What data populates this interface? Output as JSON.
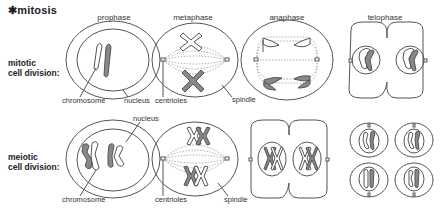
{
  "title": "✱mitosis",
  "phases": [
    "prophase",
    "metaphase",
    "anaphase",
    "telophase"
  ],
  "rows": [
    {
      "label_line1": "mitotic",
      "label_line2": "cell division:"
    },
    {
      "label_line1": "meiotic",
      "label_line2": "cell division:"
    }
  ],
  "annotations": {
    "mitotic": {
      "chromosome": "chromosome",
      "nucleus": "nucleus",
      "centrioles": "centrioles",
      "spindle": "spindle"
    },
    "meiotic": {
      "nucleus": "nucleus",
      "chromosome": "chromosome",
      "centrioles": "centrioles",
      "spindle": "spindle"
    }
  },
  "colors": {
    "outline": "#555555",
    "chromosome_fill": "#888888",
    "background": "#ffffff"
  }
}
